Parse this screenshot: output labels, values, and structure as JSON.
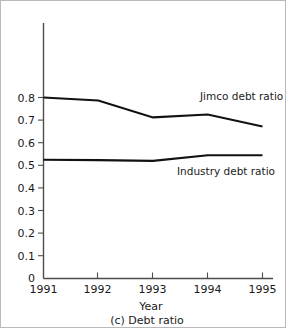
{
  "chart_data": {
    "type": "line",
    "title": "",
    "caption": "(c) Debt ratio",
    "xlabel": "Year",
    "ylabel": "",
    "categories": [
      "1991",
      "1992",
      "1993",
      "1994",
      "1995"
    ],
    "x": [
      1991,
      1992,
      1993,
      1994,
      1995
    ],
    "xlim": [
      1991,
      1995
    ],
    "ylim": [
      0,
      0.85
    ],
    "yticks": [
      0,
      0.1,
      0.2,
      0.3,
      0.4,
      0.5,
      0.6,
      0.7,
      0.8
    ],
    "ytick_labels": [
      "0",
      "0.1",
      "0.2",
      "0.3",
      "0.4",
      "0.5",
      "0.6",
      "0.7",
      "0.8"
    ],
    "xtick_labels": [
      "1991",
      "1992",
      "1993",
      "1994",
      "1995"
    ],
    "grid": false,
    "legend_position": "inline-annotation",
    "series": [
      {
        "name": "Jimco debt ratio",
        "label": "Jimco debt ratio",
        "color": "#111111",
        "values": [
          0.8,
          0.787,
          0.712,
          0.725,
          0.672
        ]
      },
      {
        "name": "Industry debt ratio",
        "label": "Industry debt ratio",
        "color": "#111111",
        "values": [
          0.525,
          0.523,
          0.52,
          0.545,
          0.545
        ]
      }
    ],
    "annotations": [
      {
        "text": "Jimco debt ratio",
        "x": 199,
        "y": 99
      },
      {
        "text": "Industry debt ratio",
        "x": 176,
        "y": 174
      }
    ]
  }
}
